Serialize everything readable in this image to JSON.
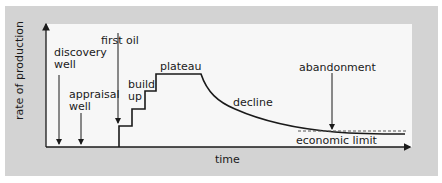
{
  "diagram": {
    "type": "oil-field-production-profile",
    "axes": {
      "x_label": "time",
      "y_label": "rate of production"
    },
    "labels": {
      "discovery_well": [
        "discovery",
        "well"
      ],
      "appraisal_well": [
        "appraisal",
        "well"
      ],
      "first_oil": "first oil",
      "build_up": [
        "build",
        "up"
      ],
      "plateau": "plateau",
      "decline": "decline",
      "abandonment": "abandonment",
      "economic_limit": "economic limit"
    },
    "colors": {
      "panel": "#d3d3d3",
      "plot_area": "#f7f7f7",
      "line": "#1a1a1a",
      "dashed_limit": "#555555"
    },
    "stages": [
      "discovery well",
      "appraisal well",
      "first oil",
      "build up",
      "plateau",
      "decline",
      "abandonment"
    ]
  }
}
